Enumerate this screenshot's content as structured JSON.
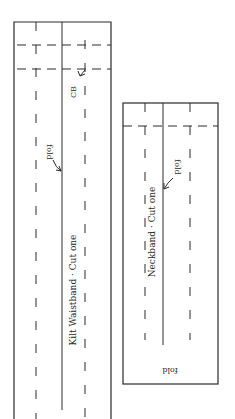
{
  "diagram": {
    "type": "sewing-pattern-pieces",
    "colors": {
      "line": "#2a2a2a",
      "background": "#ffffff"
    },
    "pieces": [
      {
        "id": "kilt-waistband",
        "name_label": "Kilt Waistband · Cut one",
        "fold_label": "fold",
        "center_back_label": "CB"
      },
      {
        "id": "neckband",
        "name_label": "Neckband · Cut one",
        "fold_label": "fold",
        "bottom_fold_label": "fold"
      }
    ]
  }
}
